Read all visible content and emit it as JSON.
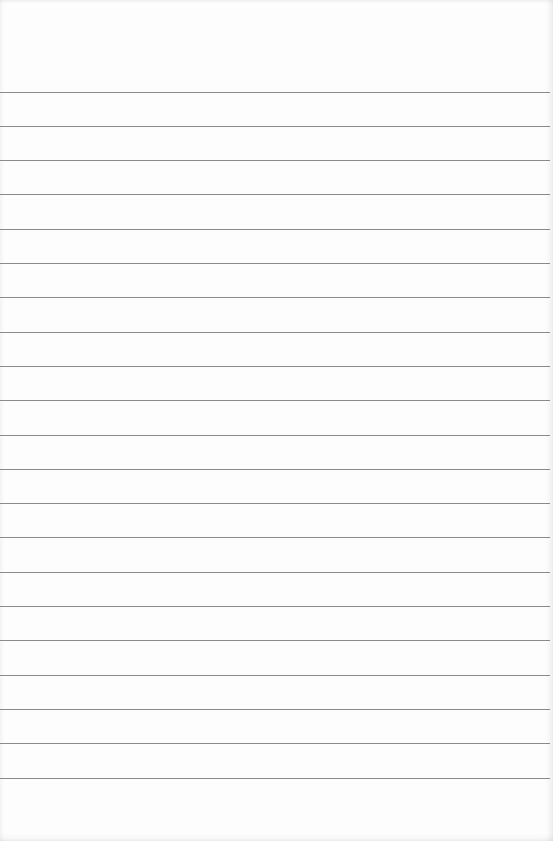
{
  "page": {
    "type": "blank ruled notepad sheet",
    "background_color": "#fdfdfd",
    "rule_color": "#7d7d7d",
    "rule_count": 21,
    "first_rule_y": 91.5,
    "rule_spacing": 34.3,
    "text_content": ""
  }
}
